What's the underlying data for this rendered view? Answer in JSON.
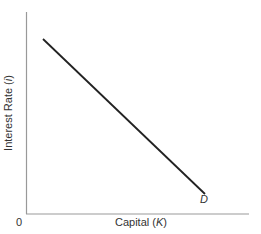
{
  "diagram": {
    "y_axis_label": "Interest Rate",
    "y_axis_symbol": "i",
    "x_axis_label": "Capital",
    "x_axis_symbol": "K",
    "origin_label": "0",
    "curve_label": "D",
    "curve": {
      "name": "Demand for capital",
      "from": [
        43,
        39
      ],
      "to": [
        205,
        194
      ],
      "slope": "downward"
    },
    "colors": {
      "axis": "#888888",
      "line": "#222222",
      "text": "#333333"
    }
  }
}
